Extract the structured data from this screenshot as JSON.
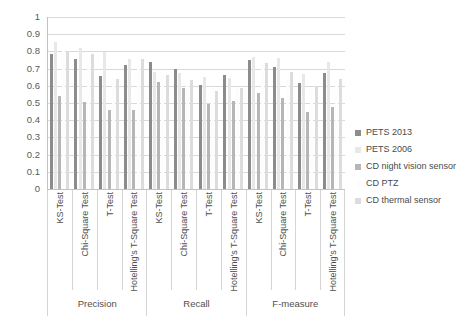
{
  "chart_data": {
    "type": "bar",
    "title": "",
    "subtitle": "",
    "xlabel": "",
    "ylabel": "",
    "ylim": [
      0,
      1
    ],
    "ytick_labels": [
      "1",
      "0.9",
      "0.8",
      "0.7",
      "0.6",
      "0.5",
      "0.4",
      "0.3",
      "0.2",
      "0.1",
      "0"
    ],
    "ytick_values": [
      1,
      0.9,
      0.8,
      0.7,
      0.6,
      0.5,
      0.4,
      0.3,
      0.2,
      0.1,
      0
    ],
    "grid": true,
    "grid_axis": "y",
    "legend_position": "right",
    "groups": [
      "Precision",
      "Recall",
      "F-measure"
    ],
    "categories": [
      "KS-Test",
      "Chi-Square Test",
      "T-Test",
      "Hotelling's T-Square Test",
      "KS-Test",
      "Chi-Square Test",
      "T-Test",
      "Hotelling's T-Square Test",
      "KS-Test",
      "Chi-Square Test",
      "T-Test",
      "Hotelling's T-Square Test"
    ],
    "series": [
      {
        "name": "PETS 2013",
        "color": "#8c8c8c",
        "values": [
          0.785,
          0.755,
          0.655,
          0.722,
          0.74,
          0.697,
          0.607,
          0.664,
          0.75,
          0.712,
          0.618,
          0.676
        ]
      },
      {
        "name": "PETS 2006",
        "color": "#e8e8e8",
        "values": [
          0.852,
          0.82,
          0.795,
          0.758,
          0.68,
          0.672,
          0.65,
          0.645,
          0.77,
          0.76,
          0.668,
          0.74
        ]
      },
      {
        "name": "CD night vision sensor",
        "color": "#b6b6b6",
        "values": [
          0.538,
          0.506,
          0.462,
          0.459,
          0.62,
          0.59,
          0.492,
          0.512,
          0.56,
          0.53,
          0.448,
          0.477
        ]
      },
      {
        "name": "CD PTZ",
        "color": "#fdfdfd",
        "values": [
          0.8,
          0.775,
          0.645,
          0.76,
          0.672,
          0.61,
          0.572,
          0.592,
          0.735,
          0.652,
          0.595,
          0.598
        ]
      },
      {
        "name": "CD thermal sensor",
        "color": "#dcdcdc",
        "values": [
          0.805,
          0.785,
          0.64,
          0.755,
          0.66,
          0.632,
          0.57,
          0.59,
          0.73,
          0.68,
          0.6,
          0.64
        ]
      }
    ]
  },
  "legend": {
    "items": [
      {
        "label": "PETS 2013"
      },
      {
        "label": "PETS 2006"
      },
      {
        "label": "CD night vision sensor"
      },
      {
        "label": "CD PTZ"
      },
      {
        "label": "CD thermal sensor"
      }
    ]
  },
  "axis": {
    "y_ticks": [
      "1",
      "0.9",
      "0.8",
      "0.7",
      "0.6",
      "0.5",
      "0.4",
      "0.3",
      "0.2",
      "0.1",
      "0"
    ],
    "x_categories": [
      "KS-Test",
      "Chi-Square Test",
      "T-Test",
      "Hotelling's T-Square Test",
      "KS-Test",
      "Chi-Square Test",
      "T-Test",
      "Hotelling's T-Square Test",
      "KS-Test",
      "Chi-Square Test",
      "T-Test",
      "Hotelling's T-Square Test"
    ],
    "groups": [
      "Precision",
      "Recall",
      "F-measure"
    ]
  },
  "colors": {
    "grid": "#d9d9d9",
    "axis": "#c2c2c2",
    "text": "#4a4a4a",
    "background": "#ffffff"
  }
}
